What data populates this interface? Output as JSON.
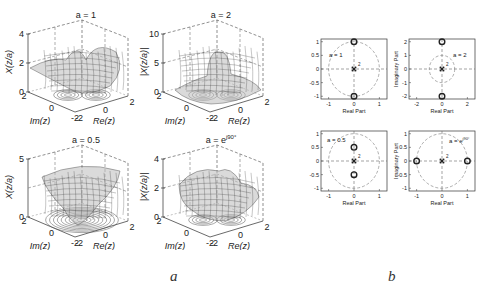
{
  "captions": {
    "a": "a",
    "b": "b"
  },
  "chart_data": [
    {
      "type": "surface3d",
      "id": "a1",
      "title": "a = 1",
      "zlabel": "X(z/a)",
      "xlabel": "Re(z)",
      "ylabel": "Im(z)",
      "zticks": [
        "0",
        "2",
        "4"
      ],
      "xticks": [
        "-2",
        "0",
        "2"
      ],
      "yticks": [
        "-2",
        "0",
        "2"
      ],
      "zlim": [
        0,
        4
      ]
    },
    {
      "type": "surface3d",
      "id": "a2",
      "title": "a = 2",
      "zlabel": "|X(z/a)|",
      "xlabel": "Re(z)",
      "ylabel": "Im(z)",
      "zticks": [
        "0",
        "5",
        "10"
      ],
      "xticks": [
        "-2",
        "0",
        "2"
      ],
      "yticks": [
        "-2",
        "0",
        "2"
      ],
      "zlim": [
        0,
        10
      ]
    },
    {
      "type": "surface3d",
      "id": "a3",
      "title": "a = 0.5",
      "zlabel": "X(z/a)",
      "xlabel": "Re(z)",
      "ylabel": "Im(z)",
      "zticks": [
        "0",
        "5"
      ],
      "xticks": [
        "-2",
        "0",
        "2"
      ],
      "yticks": [
        "-2",
        "0",
        "2"
      ],
      "zlim": [
        0,
        5
      ]
    },
    {
      "type": "surface3d",
      "id": "a4",
      "title": "a = e^{j90°}",
      "title_base": "a = e",
      "title_sup": "j90°",
      "zlabel": "|X(z/a)|",
      "xlabel": "Re(z)",
      "ylabel": "Im(z)",
      "zticks": [
        "0",
        "2",
        "4"
      ],
      "xticks": [
        "-2",
        "0",
        "2"
      ],
      "yticks": [
        "-2",
        "0",
        "2"
      ],
      "zlim": [
        0,
        4
      ]
    },
    {
      "type": "scatter",
      "id": "b1",
      "title": "a = 1",
      "xlabel": "Real Part",
      "ylabel": "",
      "xticks": [
        "-1",
        "0",
        "1"
      ],
      "yticks": [
        "1",
        "0.5",
        "0",
        "-0.5",
        "-1"
      ],
      "xlim": [
        -1.3,
        1.3
      ],
      "ylim": [
        -1.1,
        1.1
      ],
      "unit_circle_radius": 1,
      "zeros": [
        [
          0,
          1
        ],
        [
          0,
          -1
        ]
      ],
      "poles": [
        [
          0,
          0
        ]
      ],
      "pole_multiplicity": "2"
    },
    {
      "type": "scatter",
      "id": "b2",
      "title": "a = 2",
      "xlabel": "Real Part",
      "ylabel": "Imaginary Part",
      "xticks": [
        "-2",
        "0",
        "2"
      ],
      "yticks": [
        "2",
        "1",
        "0",
        "-1",
        "-2"
      ],
      "xlim": [
        -2.6,
        2.6
      ],
      "ylim": [
        -2.2,
        2.2
      ],
      "unit_circle_radius": 1,
      "zeros": [
        [
          0,
          2
        ],
        [
          0,
          -2
        ]
      ],
      "poles": [
        [
          0,
          0
        ]
      ],
      "pole_multiplicity": "2"
    },
    {
      "type": "scatter",
      "id": "b3",
      "title": "a = 0.5",
      "xlabel": "Real Part",
      "ylabel": "",
      "xticks": [
        "-1",
        "0",
        "1"
      ],
      "yticks": [
        "1",
        "0.5",
        "0",
        "-0.5",
        "-1"
      ],
      "xlim": [
        -1.3,
        1.3
      ],
      "ylim": [
        -1.1,
        1.1
      ],
      "unit_circle_radius": 1,
      "zeros": [
        [
          0,
          0.5
        ],
        [
          0,
          -0.5
        ]
      ],
      "poles": [
        [
          0,
          0
        ]
      ],
      "pole_multiplicity": "2"
    },
    {
      "type": "scatter",
      "id": "b4",
      "title": "a = e^{j90°}",
      "title_base": "a = e",
      "title_sup": "j90°",
      "xlabel": "Real Part",
      "ylabel": "Imaginary Part",
      "xticks": [
        "-1",
        "0",
        "1"
      ],
      "yticks": [
        "1",
        "0.5",
        "0",
        "-0.5",
        "-1"
      ],
      "xlim": [
        -1.3,
        1.3
      ],
      "ylim": [
        -1.1,
        1.1
      ],
      "unit_circle_radius": 1,
      "zeros": [
        [
          -1,
          0
        ],
        [
          1,
          0
        ]
      ],
      "poles": [
        [
          0,
          0
        ]
      ],
      "pole_multiplicity": "2"
    }
  ]
}
